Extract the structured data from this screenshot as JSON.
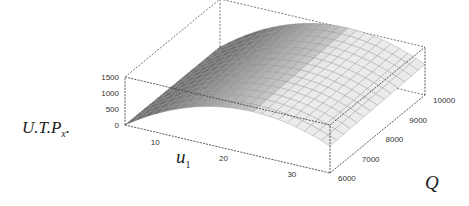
{
  "chart_data": {
    "type": "surface3d",
    "title": "",
    "zlabel": "U.T.P",
    "zlabel_subscript": "x",
    "zlabel_suffix": ".",
    "xlabel": "u",
    "xlabel_subscript": "1",
    "ylabel": "Q",
    "x_ticks": [
      "10",
      "20",
      "30"
    ],
    "y_ticks": [
      "6000",
      "7000",
      "8000",
      "9000",
      "10000"
    ],
    "z_ticks": [
      "0",
      "500",
      "1000",
      "1500"
    ],
    "x_range": [
      5,
      35
    ],
    "y_range": [
      6000,
      10000
    ],
    "z_range": [
      0,
      1500
    ],
    "surface_description": "Concave (inverted parabola) in u1, peaking near u1≈25 with max ≈1500; weakly increasing in Q",
    "surface_color": "#d8d8d8",
    "mesh_color": "#8a8a8a",
    "box_style": "dashed"
  }
}
